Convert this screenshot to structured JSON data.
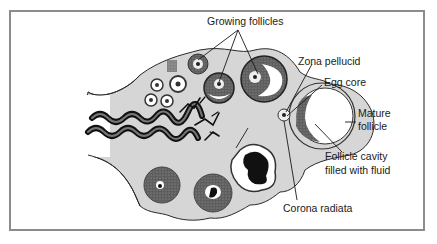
{
  "labels": {
    "growing_follicles": "Growing follicles",
    "zona_pellucid": "Zona pellucid",
    "egg_core": "Egg core",
    "mature_follicle_1": "Mature",
    "mature_follicle_2": "follicle",
    "follicle_cavity_1": "Follicle cavity",
    "follicle_cavity_2": "filled with fluid",
    "corona_radiata": "Corona radiata"
  },
  "colors": {
    "tissue": "#d6d6d6",
    "ink": "#1c1c1c",
    "granulosa": "#6e6e6e",
    "frame": "#8c8c8c"
  }
}
